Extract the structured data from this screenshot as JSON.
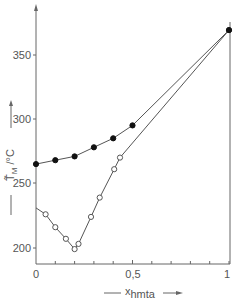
{
  "chart_data": {
    "type": "line",
    "title": "",
    "xlabel": "x_hmta",
    "ylabel": "T̃_M /°C",
    "xlim": [
      0,
      1
    ],
    "ylim": [
      190,
      375
    ],
    "x_ticks": [
      "0",
      "0.5",
      "1"
    ],
    "x_tick_labels": [
      "0",
      "0,5",
      "1"
    ],
    "y_ticks": [
      200,
      250,
      300,
      350
    ],
    "grid": false,
    "legend": null,
    "series": [
      {
        "name": "filled circles",
        "marker": "filled-circle",
        "points": [
          {
            "x": 0.0,
            "y": 265
          },
          {
            "x": 0.1,
            "y": 268
          },
          {
            "x": 0.2,
            "y": 271
          },
          {
            "x": 0.3,
            "y": 278
          },
          {
            "x": 0.4,
            "y": 285
          },
          {
            "x": 0.5,
            "y": 295
          },
          {
            "x": 1.0,
            "y": 369
          }
        ]
      },
      {
        "name": "open circles",
        "marker": "open-circle",
        "line_start": {
          "x": 0.0,
          "y": 231
        },
        "points": [
          {
            "x": 0.05,
            "y": 226
          },
          {
            "x": 0.1,
            "y": 216
          },
          {
            "x": 0.155,
            "y": 207
          },
          {
            "x": 0.2,
            "y": 199
          },
          {
            "x": 0.22,
            "y": 203
          },
          {
            "x": 0.285,
            "y": 224
          },
          {
            "x": 0.33,
            "y": 239
          },
          {
            "x": 0.405,
            "y": 261
          },
          {
            "x": 0.435,
            "y": 270
          },
          {
            "x": 1.0,
            "y": 369
          }
        ]
      }
    ]
  },
  "labels": {
    "y_tick_350": "350",
    "y_tick_300": "300",
    "y_tick_250": "250",
    "y_tick_200": "200",
    "x_tick_0": "0",
    "x_tick_05": "0,5",
    "x_tick_1": "1",
    "y_label_main": "T̃",
    "y_label_sub": "M",
    "y_label_unit": " /°C",
    "x_label_main": "x",
    "x_label_sub": "hmta"
  }
}
